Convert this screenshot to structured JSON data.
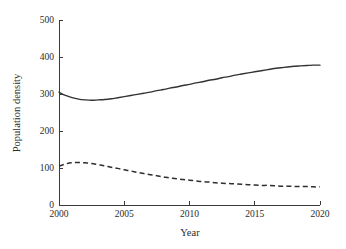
{
  "chart_data": {
    "type": "line",
    "title": "",
    "xlabel": "Year",
    "ylabel": "Population density",
    "xlim": [
      2000,
      2020
    ],
    "ylim": [
      0,
      500
    ],
    "grid": false,
    "legend": "none",
    "xticks": [
      2000,
      2005,
      2010,
      2015,
      2020
    ],
    "xtick_labels": [
      "2000",
      "2005",
      "2010",
      "2015",
      "2020"
    ],
    "yticks": [
      0,
      100,
      200,
      300,
      400,
      500
    ],
    "ytick_labels": [
      "0",
      "100",
      "200",
      "300",
      "400",
      "500"
    ],
    "x": [
      2000,
      2000.5,
      2001,
      2001.5,
      2002,
      2002.5,
      2003,
      2003.5,
      2004,
      2004.5,
      2005,
      2005.5,
      2006,
      2006.5,
      2007,
      2007.5,
      2008,
      2008.5,
      2009,
      2009.5,
      2010,
      2010.5,
      2011,
      2011.5,
      2012,
      2012.5,
      2013,
      2013.5,
      2014,
      2014.5,
      2015,
      2015.5,
      2016,
      2016.5,
      2017,
      2017.5,
      2018,
      2018.5,
      2019,
      2019.5,
      2020
    ],
    "series": [
      {
        "name": "solid-series",
        "style": "solid",
        "color": "#333333",
        "values": [
          305,
          296,
          290,
          286,
          284,
          283,
          284,
          285,
          287,
          290,
          293,
          296,
          299,
          302,
          305,
          309,
          312,
          316,
          319,
          323,
          326,
          330,
          333,
          337,
          340,
          344,
          347,
          351,
          354,
          357,
          360,
          363,
          366,
          369,
          371,
          373,
          375,
          376,
          377,
          378,
          378
        ]
      },
      {
        "name": "dashed-series",
        "style": "dashed",
        "color": "#2e2e2e",
        "values": [
          105,
          111,
          114,
          115,
          114,
          112,
          109,
          106,
          102,
          99,
          95,
          92,
          88,
          85,
          82,
          79,
          76,
          73,
          71,
          69,
          67,
          65,
          63,
          62,
          60,
          59,
          58,
          57,
          56,
          55,
          54,
          53,
          53,
          52,
          51,
          51,
          50,
          50,
          50,
          49,
          49
        ]
      }
    ],
    "annotations": []
  },
  "figure": {
    "background_color": "#ffffff",
    "axis_color": "#3a3a3a"
  }
}
